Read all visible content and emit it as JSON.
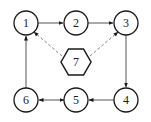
{
  "diagram": {
    "type": "directed-graph",
    "nodes": [
      {
        "id": "1",
        "label": "1",
        "shape": "circle",
        "x": 26,
        "y": 23
      },
      {
        "id": "2",
        "label": "2",
        "shape": "circle",
        "x": 76,
        "y": 23
      },
      {
        "id": "3",
        "label": "3",
        "shape": "circle",
        "x": 126,
        "y": 23
      },
      {
        "id": "4",
        "label": "4",
        "shape": "circle",
        "x": 126,
        "y": 100
      },
      {
        "id": "5",
        "label": "5",
        "shape": "circle",
        "x": 76,
        "y": 100
      },
      {
        "id": "6",
        "label": "6",
        "shape": "circle",
        "x": 26,
        "y": 100
      },
      {
        "id": "7",
        "label": "7",
        "shape": "hexagon",
        "x": 76,
        "y": 62
      }
    ],
    "edges": [
      {
        "from": "1",
        "to": "2",
        "style": "solid",
        "direction": "forward"
      },
      {
        "from": "2",
        "to": "3",
        "style": "solid",
        "direction": "forward"
      },
      {
        "from": "3",
        "to": "4",
        "style": "solid",
        "direction": "forward"
      },
      {
        "from": "4",
        "to": "5",
        "style": "solid",
        "direction": "forward"
      },
      {
        "from": "5",
        "to": "6",
        "style": "solid",
        "direction": "both"
      },
      {
        "from": "6",
        "to": "1",
        "style": "solid",
        "direction": "forward"
      },
      {
        "from": "7",
        "to": "1",
        "style": "dashed",
        "direction": "forward"
      },
      {
        "from": "7",
        "to": "3",
        "style": "dashed",
        "direction": "forward"
      }
    ]
  }
}
